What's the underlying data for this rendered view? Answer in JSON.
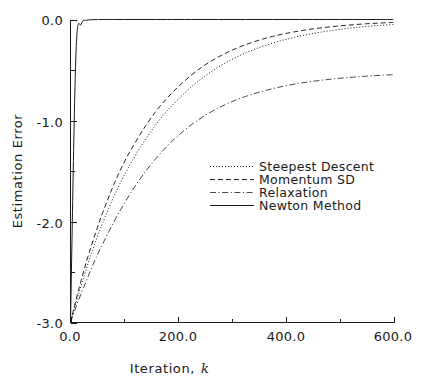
{
  "chart_data": {
    "type": "line",
    "title": "",
    "subtitle": "",
    "xlabel": "Iteration, k",
    "xlabel_main": "Iteration,",
    "xlabel_italic": "k",
    "ylabel": "Estimation Error",
    "xlim": [
      0.0,
      600.0
    ],
    "ylim": [
      -3.0,
      0.0
    ],
    "grid": false,
    "legend_position": "center-right",
    "x_ticks": [
      {
        "value": 0.0,
        "label": "0.0",
        "major": true
      },
      {
        "value": 100.0,
        "label": "",
        "major": false
      },
      {
        "value": 200.0,
        "label": "200.0",
        "major": true
      },
      {
        "value": 300.0,
        "label": "",
        "major": false
      },
      {
        "value": 400.0,
        "label": "400.0",
        "major": true
      },
      {
        "value": 500.0,
        "label": "",
        "major": false
      },
      {
        "value": 600.0,
        "label": "600.0",
        "major": true
      }
    ],
    "y_ticks": [
      {
        "value": 0.0,
        "label": "0.0",
        "major": true
      },
      {
        "value": -0.5,
        "label": "",
        "major": false
      },
      {
        "value": -1.0,
        "label": "-1.0",
        "major": true
      },
      {
        "value": -1.5,
        "label": "",
        "major": false
      },
      {
        "value": -2.0,
        "label": "-2.0",
        "major": true
      },
      {
        "value": -2.5,
        "label": "",
        "major": false
      },
      {
        "value": -3.0,
        "label": "-3.0",
        "major": true
      }
    ],
    "x": [
      0,
      10,
      20,
      30,
      40,
      50,
      60,
      80,
      100,
      120,
      140,
      160,
      180,
      200,
      225,
      250,
      275,
      300,
      325,
      350,
      375,
      400,
      425,
      450,
      475,
      500,
      525,
      550,
      575,
      600
    ],
    "series": [
      {
        "name": "Steepest Descent",
        "style": "dotted",
        "color": "#1a1a1a",
        "values": [
          -3.0,
          -2.81,
          -2.63,
          -2.46,
          -2.3,
          -2.15,
          -2.01,
          -1.76,
          -1.54,
          -1.35,
          -1.18,
          -1.03,
          -0.9,
          -0.79,
          -0.665,
          -0.56,
          -0.47,
          -0.395,
          -0.332,
          -0.279,
          -0.234,
          -0.197,
          -0.165,
          -0.139,
          -0.117,
          -0.098,
          -0.082,
          -0.069,
          -0.058,
          -0.049
        ]
      },
      {
        "name": "Momentum SD",
        "style": "dashed",
        "color": "#1a1a1a",
        "values": [
          -3.0,
          -2.78,
          -2.58,
          -2.39,
          -2.22,
          -2.06,
          -1.91,
          -1.64,
          -1.41,
          -1.22,
          -1.05,
          -0.9,
          -0.775,
          -0.667,
          -0.548,
          -0.45,
          -0.37,
          -0.304,
          -0.25,
          -0.205,
          -0.168,
          -0.138,
          -0.114,
          -0.093,
          -0.077,
          -0.063,
          -0.052,
          -0.042,
          -0.035,
          -0.029
        ]
      },
      {
        "name": "Relaxation",
        "style": "dashdot",
        "color": "#1a1a1a",
        "values": [
          -3.0,
          -2.85,
          -2.71,
          -2.58,
          -2.45,
          -2.33,
          -2.22,
          -2.01,
          -1.82,
          -1.65,
          -1.5,
          -1.37,
          -1.25,
          -1.15,
          -1.04,
          -0.95,
          -0.875,
          -0.813,
          -0.762,
          -0.72,
          -0.685,
          -0.656,
          -0.632,
          -0.612,
          -0.596,
          -0.582,
          -0.571,
          -0.561,
          -0.553,
          -0.546
        ]
      },
      {
        "name": "Newton Method",
        "style": "solid",
        "color": "#1a1a1a",
        "values": [
          -3.0,
          -0.36,
          -0.045,
          -0.008,
          -0.002,
          -0.001,
          0.0,
          0.0,
          0.0,
          0.0,
          0.0,
          0.0,
          0.0,
          0.0,
          0.0,
          0.0,
          0.0,
          0.0,
          0.0,
          0.0,
          0.0,
          0.0,
          0.0,
          0.0,
          0.0,
          0.0,
          0.0,
          0.0,
          0.0,
          0.0
        ]
      }
    ],
    "legend": [
      {
        "label": "Steepest Descent",
        "style": "dotted"
      },
      {
        "label": "Momentum SD",
        "style": "dashed"
      },
      {
        "label": "Relaxation",
        "style": "dashdot"
      },
      {
        "label": "Newton Method",
        "style": "solid"
      }
    ]
  },
  "axis": {
    "y_label": "Estimation Error",
    "x_label_main": "Iteration,",
    "x_label_var": "k",
    "y_tick_0": "0.0",
    "y_tick_1": "-1.0",
    "y_tick_2": "-2.0",
    "y_tick_3": "-3.0",
    "x_tick_0": "0.0",
    "x_tick_1": "200.0",
    "x_tick_2": "400.0",
    "x_tick_3": "600.0"
  },
  "legend": {
    "item_0": "Steepest Descent",
    "item_1": "Momentum SD",
    "item_2": "Relaxation",
    "item_3": "Newton Method"
  },
  "colors": {
    "ink": "#1a1a1a",
    "background": "#ffffff"
  }
}
